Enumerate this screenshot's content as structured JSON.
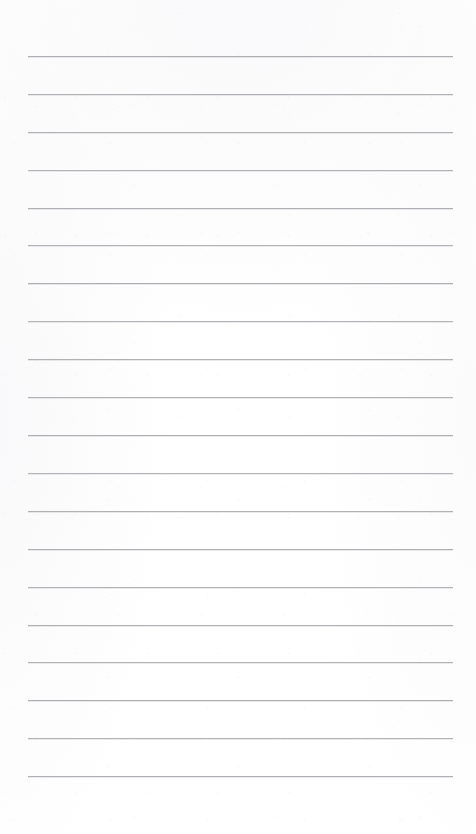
{
  "document": {
    "kind": "scanned-blank-ruled-page",
    "page_label": "",
    "header_text": "",
    "footer_text": "",
    "body_text": "",
    "handwriting_present": "false",
    "printed_text_present": "false"
  },
  "canvas": {
    "width": 476,
    "height": 834,
    "background_color": "#ffffff"
  },
  "ruling": {
    "line_color": "#a9a9ad",
    "line_thickness_px": 1,
    "line_count": 20,
    "first_line_y": 56,
    "last_line_y": 776,
    "line_spacing_px": 37.9,
    "line_left_x": 28,
    "line_right_x": 453,
    "left_margin_px": 28,
    "right_margin_px": 23,
    "bottom_blank_px": 58,
    "vertical_margin_rule": "none",
    "lines": [
      {
        "index": 1,
        "y": 56,
        "left": 28,
        "right": 453,
        "opacity": 0.92
      },
      {
        "index": 2,
        "y": 94,
        "left": 28,
        "right": 453,
        "opacity": 0.88
      },
      {
        "index": 3,
        "y": 132,
        "left": 28,
        "right": 453,
        "opacity": 0.9
      },
      {
        "index": 4,
        "y": 170,
        "left": 28,
        "right": 453,
        "opacity": 0.86
      },
      {
        "index": 5,
        "y": 208,
        "left": 28,
        "right": 453,
        "opacity": 0.91
      },
      {
        "index": 6,
        "y": 245,
        "left": 28,
        "right": 453,
        "opacity": 0.87
      },
      {
        "index": 7,
        "y": 283,
        "left": 28,
        "right": 453,
        "opacity": 0.93
      },
      {
        "index": 8,
        "y": 321,
        "left": 28,
        "right": 453,
        "opacity": 0.85
      },
      {
        "index": 9,
        "y": 359,
        "left": 28,
        "right": 453,
        "opacity": 0.9
      },
      {
        "index": 10,
        "y": 397,
        "left": 28,
        "right": 453,
        "opacity": 0.88
      },
      {
        "index": 11,
        "y": 435,
        "left": 28,
        "right": 453,
        "opacity": 0.92
      },
      {
        "index": 12,
        "y": 473,
        "left": 28,
        "right": 453,
        "opacity": 0.86
      },
      {
        "index": 13,
        "y": 511,
        "left": 28,
        "right": 453,
        "opacity": 0.89
      },
      {
        "index": 14,
        "y": 549,
        "left": 28,
        "right": 453,
        "opacity": 0.91
      },
      {
        "index": 15,
        "y": 587,
        "left": 28,
        "right": 453,
        "opacity": 0.87
      },
      {
        "index": 16,
        "y": 625,
        "left": 28,
        "right": 453,
        "opacity": 0.9
      },
      {
        "index": 17,
        "y": 662,
        "left": 28,
        "right": 453,
        "opacity": 0.88
      },
      {
        "index": 18,
        "y": 700,
        "left": 28,
        "right": 453,
        "opacity": 0.93
      },
      {
        "index": 19,
        "y": 738,
        "left": 28,
        "right": 453,
        "opacity": 0.89
      },
      {
        "index": 20,
        "y": 776,
        "left": 28,
        "right": 453,
        "opacity": 0.91
      }
    ]
  }
}
